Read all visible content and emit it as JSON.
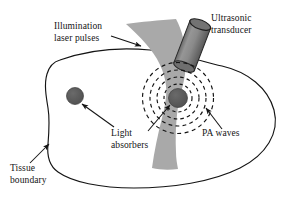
{
  "figure": {
    "domain": "diagram",
    "background_color": "#ffffff",
    "width": 293,
    "height": 204
  },
  "colors": {
    "outline": "#141414",
    "laser_beam_fill": "#a9a9a9",
    "absorber_fill": "#565656",
    "transducer_body_light": "#8c8c8c",
    "transducer_body_dark": "#5e5e5e",
    "transducer_cap": "#6e6e6e",
    "text": "#141414",
    "tissue_fill": "#ffffff",
    "pa_wave_stroke": "#141414"
  },
  "labels": {
    "illumination": {
      "line1": "Illumination",
      "line2": "laser pulses",
      "x": 54,
      "y": 29
    },
    "ultrasonic": {
      "line1": "Ultrasonic",
      "line2": "transducer",
      "x": 211,
      "y": 21
    },
    "light_absorbers": {
      "line1": "Light",
      "line2": "absorbers",
      "x": 111,
      "y": 136
    },
    "pa_waves": {
      "line1": "PA waves",
      "x": 202,
      "y": 136
    },
    "tissue_boundary": {
      "line1": "Tissue",
      "line2": "boundary",
      "x": 10,
      "y": 171
    }
  },
  "elements": {
    "tissue_boundary_shape": "irregular-closed-blob",
    "laser_beam_shape": "hourglass-cone",
    "transducer_shape": "tilted-cylinder",
    "pa_waves_count": 4,
    "pa_waves_style": "dashed-concentric-circles",
    "pa_waves_center_x": 178,
    "pa_waves_center_y": 98,
    "pa_waves_radii": [
      14,
      21,
      28,
      35.5
    ],
    "absorbers": [
      {
        "name": "left-absorber",
        "cx": 75,
        "cy": 96,
        "r": 8.5
      },
      {
        "name": "center-absorber",
        "cx": 178,
        "cy": 98,
        "r": 9.5
      }
    ]
  },
  "arrows": {
    "illumination_arrow": {
      "from_x": 111,
      "from_y": 36,
      "to_x": 141,
      "to_y": 46
    },
    "left_absorber_arrow": {
      "from_x": 114,
      "from_y": 127,
      "to_x": 82,
      "to_y": 104
    },
    "center_absorber_arrow": {
      "from_x": 148,
      "from_y": 131,
      "to_x": 170,
      "to_y": 105
    },
    "pa_waves_arrow": {
      "from_x": 222,
      "from_y": 129,
      "to_x": 206,
      "to_y": 108
    },
    "tissue_boundary_arrow": {
      "from_x": 30,
      "from_y": 163,
      "to_x": 49,
      "to_y": 144
    }
  }
}
